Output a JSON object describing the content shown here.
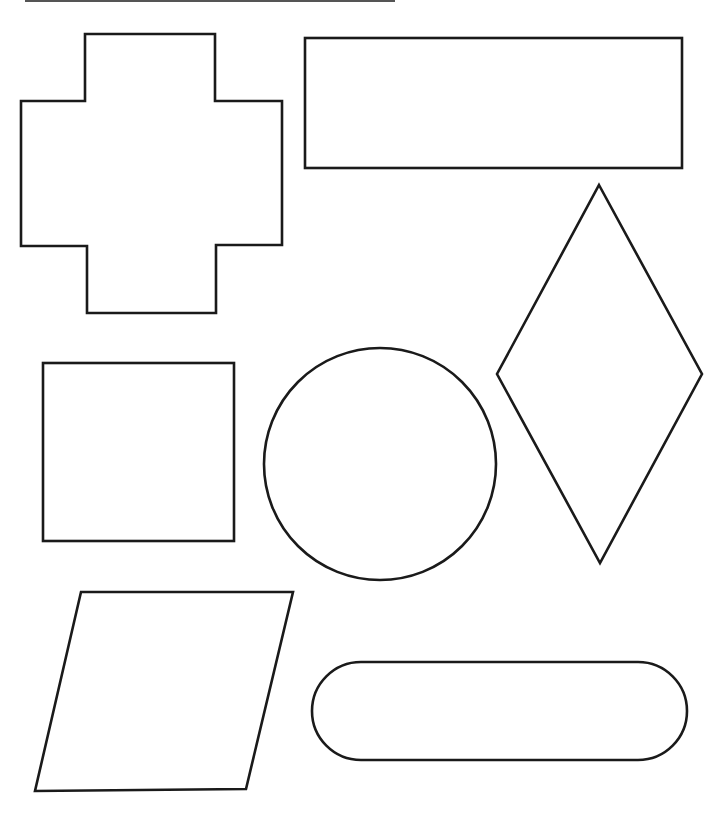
{
  "page": {
    "background": "#ffffff",
    "stroke_color": "#1a1a1a",
    "top_rule": {
      "x1": 25,
      "y1": 1,
      "x2": 395,
      "y2": 1
    }
  },
  "shapes": [
    {
      "name": "plus-cross",
      "type": "polygon",
      "points": "85,34 215,34 215,101 282,101 282,245 216,245 216,313 87,313 87,246 21,246 21,101 85,101"
    },
    {
      "name": "rectangle",
      "type": "rect",
      "x": 305,
      "y": 38,
      "w": 377,
      "h": 130
    },
    {
      "name": "diamond",
      "type": "polygon",
      "points": "599,185 702,374 600,563 497,374"
    },
    {
      "name": "square",
      "type": "rect",
      "x": 43,
      "y": 363,
      "w": 191,
      "h": 178
    },
    {
      "name": "circle",
      "type": "circle",
      "cx": 380,
      "cy": 464,
      "r": 116
    },
    {
      "name": "parallelogram",
      "type": "polygon",
      "points": "81,592 293,592 246,789 35,791"
    },
    {
      "name": "stadium-oval",
      "type": "rect",
      "x": 312,
      "y": 662,
      "w": 375,
      "h": 98,
      "rx": 49
    }
  ]
}
